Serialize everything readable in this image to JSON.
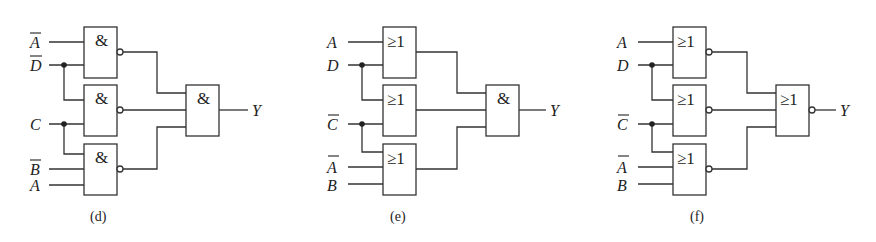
{
  "figure": {
    "circuits": [
      {
        "caption": "(d)",
        "inputs": [
          {
            "label": "A",
            "negated": true
          },
          {
            "label": "D",
            "negated": true
          },
          {
            "label": "C",
            "negated": false
          },
          {
            "label": "B",
            "negated": true
          },
          {
            "label": "A",
            "negated": false
          }
        ],
        "first_level_gates": [
          {
            "symbol": "&",
            "inverted_output": true,
            "inputs": [
              "A̅",
              "D̅"
            ]
          },
          {
            "symbol": "&",
            "inverted_output": true,
            "inputs": [
              "D̅",
              "C"
            ]
          },
          {
            "symbol": "&",
            "inverted_output": true,
            "inputs": [
              "C",
              "B̅",
              "A"
            ]
          }
        ],
        "output_gate": {
          "symbol": "&",
          "inverted_output": false
        },
        "output_label": "Y"
      },
      {
        "caption": "(e)",
        "inputs": [
          {
            "label": "A",
            "negated": false
          },
          {
            "label": "D",
            "negated": false
          },
          {
            "label": "C",
            "negated": true
          },
          {
            "label": "A",
            "negated": true
          },
          {
            "label": "B",
            "negated": false
          }
        ],
        "first_level_gates": [
          {
            "symbol": "≥1",
            "inverted_output": false,
            "inputs": [
              "A",
              "D"
            ]
          },
          {
            "symbol": "≥1",
            "inverted_output": false,
            "inputs": [
              "D",
              "C̅"
            ]
          },
          {
            "symbol": "≥1",
            "inverted_output": false,
            "inputs": [
              "C̅",
              "A̅",
              "B"
            ]
          }
        ],
        "output_gate": {
          "symbol": "&",
          "inverted_output": false
        },
        "output_label": "Y"
      },
      {
        "caption": "(f)",
        "inputs": [
          {
            "label": "A",
            "negated": false
          },
          {
            "label": "D",
            "negated": false
          },
          {
            "label": "C",
            "negated": true
          },
          {
            "label": "A",
            "negated": true
          },
          {
            "label": "B",
            "negated": false
          }
        ],
        "first_level_gates": [
          {
            "symbol": "≥1",
            "inverted_output": true,
            "inputs": [
              "A",
              "D"
            ]
          },
          {
            "symbol": "≥1",
            "inverted_output": true,
            "inputs": [
              "D",
              "C̅"
            ]
          },
          {
            "symbol": "≥1",
            "inverted_output": true,
            "inputs": [
              "C̅",
              "A̅",
              "B"
            ]
          }
        ],
        "output_gate": {
          "symbol": "≥1",
          "inverted_output": true
        },
        "output_label": "Y"
      }
    ]
  }
}
